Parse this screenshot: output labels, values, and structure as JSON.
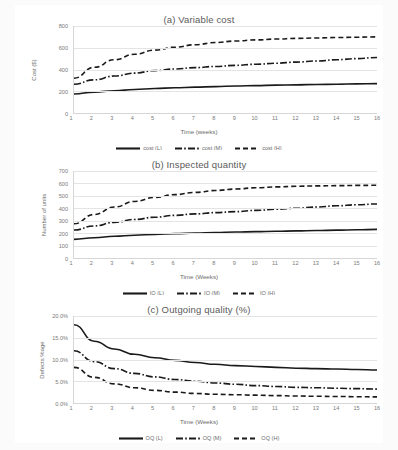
{
  "figure": {
    "panels": [
      "a",
      "b",
      "c"
    ]
  },
  "charts": [
    {
      "id": "a",
      "title": "(a) Variable cost",
      "xlabel": "Time (weeks)",
      "ylabel": "Cost ($)",
      "yticks": [
        "0",
        "200",
        "400",
        "600",
        "800"
      ],
      "xticks": [
        "1",
        "2",
        "3",
        "4",
        "5",
        "6",
        "7",
        "8",
        "9",
        "10",
        "11",
        "12",
        "13",
        "14",
        "15",
        "16"
      ],
      "legend": [
        "cost (L)",
        "cost (M)",
        "cost (H)"
      ]
    },
    {
      "id": "b",
      "title": "(b) Inspected quantity",
      "xlabel": "Time (Weeks)",
      "ylabel": "Number of units",
      "yticks": [
        "0",
        "100",
        "200",
        "300",
        "400",
        "500",
        "600",
        "700"
      ],
      "xticks": [
        "1",
        "2",
        "3",
        "4",
        "5",
        "6",
        "7",
        "8",
        "9",
        "10",
        "11",
        "12",
        "13",
        "14",
        "15",
        "16"
      ],
      "legend": [
        "IQ (L)",
        "IQ (M)",
        "IQ (H)"
      ]
    },
    {
      "id": "c",
      "title": "(c) Outgoing quality (%)",
      "xlabel": "Time (Weeks)",
      "ylabel": "Defects %age",
      "yticks": [
        "0.0%",
        "5.0%",
        "10.0%",
        "15.0%",
        "20.0%"
      ],
      "xticks": [
        "1",
        "2",
        "3",
        "4",
        "5",
        "6",
        "7",
        "8",
        "9",
        "10",
        "11",
        "12",
        "13",
        "14",
        "15",
        "16"
      ],
      "legend": [
        "OQ (L)",
        "OQ (M)",
        "OQ (H)"
      ]
    }
  ],
  "chart_data": [
    {
      "type": "line",
      "title": "(a) Variable cost",
      "xlabel": "Time (weeks)",
      "ylabel": "Cost ($)",
      "x": [
        1,
        2,
        3,
        4,
        5,
        6,
        7,
        8,
        9,
        10,
        11,
        12,
        13,
        14,
        15,
        16
      ],
      "xlim": [
        1,
        16
      ],
      "ylim": [
        0,
        800
      ],
      "ytick_values": [
        0,
        200,
        400,
        600,
        800
      ],
      "grid": true,
      "legend_position": "bottom",
      "series": [
        {
          "name": "cost (L)",
          "style": "solid",
          "values": [
            175,
            192,
            205,
            216,
            225,
            232,
            238,
            243,
            248,
            252,
            256,
            259,
            262,
            265,
            268,
            270
          ]
        },
        {
          "name": "cost (M)",
          "style": "dash-dot",
          "values": [
            265,
            305,
            340,
            367,
            390,
            405,
            417,
            428,
            438,
            448,
            458,
            468,
            478,
            490,
            500,
            510
          ]
        },
        {
          "name": "cost (H)",
          "style": "dashed",
          "values": [
            320,
            420,
            490,
            540,
            578,
            605,
            628,
            648,
            662,
            672,
            680,
            686,
            690,
            694,
            697,
            700
          ]
        }
      ]
    },
    {
      "type": "line",
      "title": "(b) Inspected quantity",
      "xlabel": "Time (Weeks)",
      "ylabel": "Number of units",
      "x": [
        1,
        2,
        3,
        4,
        5,
        6,
        7,
        8,
        9,
        10,
        11,
        12,
        13,
        14,
        15,
        16
      ],
      "xlim": [
        1,
        16
      ],
      "ylim": [
        0,
        700
      ],
      "ytick_values": [
        0,
        100,
        200,
        300,
        400,
        500,
        600,
        700
      ],
      "grid": true,
      "legend_position": "bottom",
      "series": [
        {
          "name": "IQ (L)",
          "style": "solid",
          "values": [
            150,
            163,
            175,
            183,
            190,
            196,
            201,
            205,
            209,
            212,
            215,
            218,
            221,
            224,
            227,
            230
          ]
        },
        {
          "name": "IQ (M)",
          "style": "dash-dot",
          "values": [
            225,
            258,
            287,
            310,
            328,
            343,
            355,
            365,
            373,
            383,
            392,
            400,
            410,
            420,
            428,
            435
          ]
        },
        {
          "name": "IQ (H)",
          "style": "dashed",
          "values": [
            275,
            350,
            410,
            455,
            487,
            510,
            528,
            543,
            555,
            565,
            572,
            577,
            580,
            582,
            584,
            585
          ]
        }
      ]
    },
    {
      "type": "line",
      "title": "(c) Outgoing quality (%)",
      "xlabel": "Time (Weeks)",
      "ylabel": "Defects %age",
      "x": [
        1,
        2,
        3,
        4,
        5,
        6,
        7,
        8,
        9,
        10,
        11,
        12,
        13,
        14,
        15,
        16
      ],
      "xlim": [
        1,
        16
      ],
      "ylim": [
        0,
        20
      ],
      "ytick_values": [
        0,
        5,
        10,
        15,
        20
      ],
      "unit": "%",
      "grid": true,
      "legend_position": "bottom",
      "series": [
        {
          "name": "OQ (L)",
          "style": "solid",
          "values": [
            18.0,
            14.2,
            12.4,
            11.2,
            10.4,
            9.8,
            9.3,
            8.9,
            8.6,
            8.4,
            8.2,
            8.0,
            7.9,
            7.8,
            7.7,
            7.6
          ]
        },
        {
          "name": "OQ (M)",
          "style": "dash-dot",
          "values": [
            12.0,
            9.5,
            7.9,
            6.8,
            6.0,
            5.4,
            5.0,
            4.6,
            4.3,
            4.0,
            3.8,
            3.6,
            3.5,
            3.4,
            3.3,
            3.2
          ]
        },
        {
          "name": "OQ (H)",
          "style": "dashed",
          "values": [
            8.2,
            5.9,
            4.4,
            3.5,
            2.9,
            2.5,
            2.2,
            2.0,
            1.9,
            1.8,
            1.7,
            1.6,
            1.55,
            1.5,
            1.45,
            1.4
          ]
        }
      ]
    }
  ]
}
